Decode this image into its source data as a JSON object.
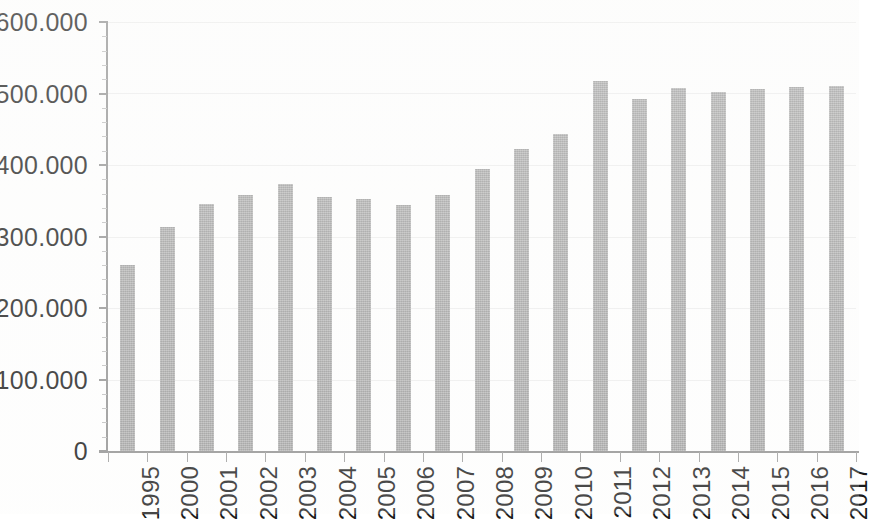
{
  "chart_data": {
    "type": "bar",
    "title": "",
    "subtitle": "",
    "xlabel": "",
    "ylabel": "",
    "categories": [
      "1995",
      "2000",
      "2001",
      "2002",
      "2003",
      "2004",
      "2005",
      "2006",
      "2007",
      "2008",
      "2009",
      "2010",
      "2011",
      "2012",
      "2013",
      "2014",
      "2015",
      "2016",
      "2017"
    ],
    "values": [
      260000,
      314000,
      345000,
      358000,
      374000,
      355000,
      353000,
      344000,
      358000,
      394000,
      423000,
      443000,
      517000,
      493000,
      508000,
      502000,
      506000,
      509000,
      511000
    ],
    "ylim": [
      0,
      600000
    ],
    "y_tick_values": [
      0,
      100000,
      200000,
      300000,
      400000,
      500000,
      600000
    ],
    "y_tick_labels": [
      "0",
      "100.000",
      "200.000",
      "300.000",
      "400.000",
      "500.000",
      "600.000"
    ],
    "grid": true,
    "grid_axis": "y",
    "legend": false,
    "legend_position": "none",
    "bar_color": "#a2a2a2",
    "axis_color": "#8d8d8d",
    "grid_color": "#ededed",
    "text_color": "#1a1a1a",
    "x_label_rotation": -90,
    "series": [
      {
        "name": "",
        "values": [
          260000,
          314000,
          345000,
          358000,
          374000,
          355000,
          353000,
          344000,
          358000,
          394000,
          423000,
          443000,
          517000,
          493000,
          508000,
          502000,
          506000,
          509000,
          511000
        ]
      }
    ],
    "annotations": []
  }
}
